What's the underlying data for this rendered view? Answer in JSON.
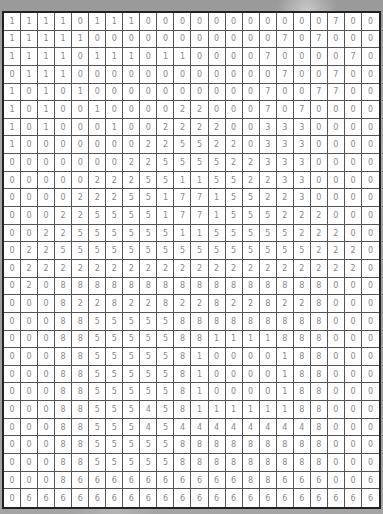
{
  "grid": {
    "rows": 28,
    "cols": 22,
    "values": [
      [
        1,
        1,
        1,
        1,
        0,
        1,
        1,
        1,
        0,
        0,
        0,
        0,
        0,
        0,
        0,
        0,
        0,
        0,
        0,
        7,
        0,
        0
      ],
      [
        1,
        1,
        1,
        1,
        1,
        0,
        0,
        0,
        0,
        0,
        0,
        0,
        0,
        0,
        0,
        0,
        7,
        0,
        7,
        0,
        0,
        0
      ],
      [
        1,
        1,
        1,
        1,
        0,
        1,
        1,
        1,
        0,
        1,
        1,
        0,
        0,
        0,
        0,
        7,
        0,
        0,
        0,
        0,
        7,
        0
      ],
      [
        0,
        1,
        1,
        1,
        0,
        0,
        0,
        0,
        0,
        0,
        0,
        0,
        0,
        0,
        0,
        0,
        7,
        0,
        0,
        7,
        0,
        0
      ],
      [
        1,
        0,
        1,
        0,
        1,
        0,
        0,
        0,
        0,
        0,
        0,
        0,
        0,
        0,
        0,
        7,
        0,
        0,
        7,
        7,
        0,
        0
      ],
      [
        1,
        0,
        1,
        0,
        0,
        1,
        0,
        0,
        0,
        0,
        2,
        2,
        0,
        0,
        0,
        7,
        0,
        7,
        0,
        0,
        0,
        0
      ],
      [
        1,
        0,
        1,
        0,
        0,
        0,
        1,
        0,
        0,
        2,
        2,
        2,
        2,
        0,
        0,
        3,
        3,
        3,
        0,
        0,
        0,
        0
      ],
      [
        1,
        0,
        0,
        0,
        0,
        0,
        0,
        0,
        2,
        2,
        5,
        5,
        2,
        2,
        0,
        3,
        3,
        3,
        0,
        0,
        0,
        0
      ],
      [
        0,
        0,
        0,
        0,
        0,
        0,
        0,
        2,
        2,
        5,
        5,
        5,
        5,
        2,
        2,
        3,
        3,
        3,
        0,
        0,
        0,
        0
      ],
      [
        0,
        0,
        0,
        0,
        0,
        2,
        2,
        2,
        5,
        5,
        1,
        1,
        5,
        5,
        2,
        2,
        3,
        3,
        0,
        0,
        0,
        0
      ],
      [
        0,
        0,
        0,
        0,
        2,
        2,
        2,
        5,
        5,
        1,
        7,
        7,
        1,
        5,
        5,
        2,
        2,
        3,
        0,
        0,
        0,
        0
      ],
      [
        0,
        0,
        0,
        2,
        2,
        5,
        5,
        5,
        5,
        1,
        7,
        7,
        1,
        5,
        5,
        5,
        2,
        2,
        2,
        0,
        0,
        0
      ],
      [
        0,
        0,
        2,
        2,
        5,
        5,
        5,
        5,
        5,
        5,
        1,
        1,
        5,
        5,
        5,
        5,
        5,
        2,
        2,
        2,
        0,
        0
      ],
      [
        0,
        2,
        2,
        5,
        5,
        5,
        5,
        5,
        5,
        5,
        5,
        5,
        5,
        5,
        5,
        5,
        5,
        5,
        2,
        2,
        2,
        0
      ],
      [
        0,
        2,
        2,
        2,
        2,
        2,
        2,
        2,
        2,
        2,
        2,
        2,
        2,
        2,
        2,
        2,
        2,
        2,
        2,
        2,
        2,
        0
      ],
      [
        0,
        2,
        0,
        8,
        8,
        8,
        8,
        8,
        8,
        8,
        8,
        8,
        8,
        8,
        8,
        8,
        8,
        8,
        8,
        0,
        0,
        0
      ],
      [
        0,
        0,
        0,
        8,
        2,
        2,
        8,
        2,
        2,
        8,
        2,
        2,
        8,
        2,
        2,
        8,
        2,
        2,
        8,
        0,
        0,
        0
      ],
      [
        0,
        0,
        0,
        8,
        8,
        5,
        5,
        5,
        5,
        5,
        8,
        8,
        8,
        8,
        8,
        8,
        8,
        8,
        8,
        0,
        0,
        0
      ],
      [
        0,
        0,
        0,
        8,
        8,
        5,
        5,
        5,
        5,
        5,
        8,
        8,
        1,
        1,
        1,
        1,
        8,
        8,
        8,
        0,
        0,
        0
      ],
      [
        0,
        0,
        0,
        8,
        8,
        5,
        5,
        5,
        5,
        5,
        8,
        1,
        0,
        0,
        0,
        0,
        1,
        8,
        8,
        0,
        0,
        0
      ],
      [
        0,
        0,
        0,
        8,
        8,
        5,
        5,
        5,
        5,
        5,
        8,
        1,
        0,
        0,
        0,
        0,
        1,
        8,
        8,
        0,
        0,
        0
      ],
      [
        0,
        0,
        0,
        8,
        8,
        5,
        5,
        5,
        5,
        5,
        8,
        1,
        0,
        0,
        0,
        0,
        1,
        8,
        8,
        0,
        0,
        0
      ],
      [
        0,
        0,
        0,
        8,
        8,
        5,
        5,
        5,
        4,
        5,
        8,
        1,
        1,
        1,
        1,
        1,
        1,
        8,
        8,
        0,
        0,
        0
      ],
      [
        0,
        0,
        0,
        8,
        8,
        5,
        5,
        5,
        4,
        5,
        4,
        4,
        4,
        4,
        4,
        4,
        4,
        4,
        8,
        0,
        0,
        0
      ],
      [
        0,
        0,
        0,
        8,
        8,
        5,
        5,
        5,
        5,
        5,
        8,
        8,
        8,
        8,
        8,
        8,
        8,
        8,
        8,
        0,
        0,
        0
      ],
      [
        0,
        0,
        0,
        8,
        8,
        5,
        5,
        5,
        5,
        5,
        8,
        8,
        8,
        8,
        8,
        8,
        8,
        8,
        8,
        0,
        0,
        0
      ],
      [
        0,
        0,
        0,
        8,
        6,
        6,
        6,
        6,
        6,
        6,
        6,
        6,
        6,
        6,
        8,
        8,
        6,
        6,
        6,
        0,
        0,
        6
      ],
      [
        0,
        6,
        6,
        6,
        6,
        6,
        6,
        6,
        6,
        6,
        6,
        6,
        6,
        6,
        6,
        6,
        6,
        6,
        6,
        6,
        6,
        6
      ]
    ]
  },
  "colors": {
    "cell_background": "#ffffff",
    "cell_text": "#888888",
    "grid_line": "#555555",
    "border": "#222222",
    "page_background": "#a0a0a0"
  }
}
